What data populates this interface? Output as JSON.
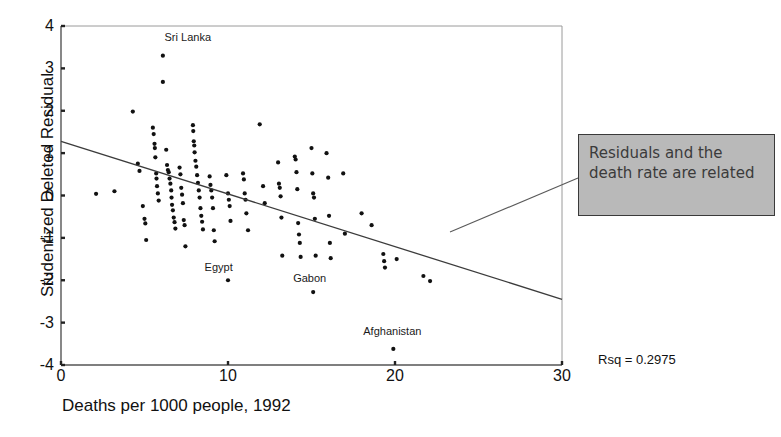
{
  "chart_data": {
    "type": "scatter",
    "title": "",
    "xlabel": "Deaths per 1000 people, 1992",
    "ylabel": "Studentized Deleted Residual",
    "xlim": [
      0,
      30
    ],
    "ylim": [
      -4,
      4
    ],
    "xticks": [
      0,
      10,
      20,
      30
    ],
    "xtick_labels": [
      "0",
      "10",
      "20",
      "30"
    ],
    "yticks": [
      4,
      3,
      2,
      1,
      0,
      -1,
      -2,
      -3,
      -4
    ],
    "ytick_labels": [
      "4",
      "3",
      "2",
      "1",
      "0",
      "-1",
      "-2",
      "-3",
      "-4"
    ],
    "grid": false,
    "legend": null,
    "regression_line": {
      "x0": 0,
      "y0": 1.28,
      "x1": 30,
      "y1": -2.45
    },
    "annotations": [
      {
        "text": "Sri Lanka",
        "x": 6.2,
        "y": 3.72
      },
      {
        "text": "Egypt",
        "x": 8.6,
        "y": -1.72
      },
      {
        "text": "Gabon",
        "x": 13.9,
        "y": -1.98
      },
      {
        "text": "Afghanistan",
        "x": 18.1,
        "y": -3.22
      },
      {
        "text": "Rsq = 0.2975",
        "x": 32.2,
        "y": -4.72
      }
    ],
    "point_labels": [
      "Sri Lanka",
      "Egypt",
      "Gabon",
      "Afghanistan"
    ],
    "points": [
      [
        2.1,
        0.04
      ],
      [
        3.2,
        0.1
      ],
      [
        4.3,
        1.98
      ],
      [
        4.6,
        0.75
      ],
      [
        4.7,
        0.58
      ],
      [
        4.9,
        -0.25
      ],
      [
        5.0,
        -0.55
      ],
      [
        5.05,
        -0.66
      ],
      [
        5.1,
        -1.05
      ],
      [
        5.5,
        1.6
      ],
      [
        5.55,
        1.45
      ],
      [
        5.6,
        1.22
      ],
      [
        5.62,
        1.12
      ],
      [
        5.65,
        0.9
      ],
      [
        5.7,
        0.52
      ],
      [
        5.72,
        0.4
      ],
      [
        5.75,
        0.22
      ],
      [
        5.8,
        0.05
      ],
      [
        5.85,
        -0.12
      ],
      [
        6.1,
        3.3
      ],
      [
        6.1,
        2.68
      ],
      [
        6.3,
        1.08
      ],
      [
        6.35,
        0.72
      ],
      [
        6.4,
        0.6
      ],
      [
        6.45,
        0.55
      ],
      [
        6.5,
        0.4
      ],
      [
        6.55,
        0.28
      ],
      [
        6.6,
        0.12
      ],
      [
        6.62,
        -0.05
      ],
      [
        6.65,
        -0.22
      ],
      [
        6.7,
        -0.35
      ],
      [
        6.75,
        -0.52
      ],
      [
        6.8,
        -0.63
      ],
      [
        6.85,
        -0.78
      ],
      [
        7.1,
        0.66
      ],
      [
        7.15,
        0.5
      ],
      [
        7.2,
        0.18
      ],
      [
        7.25,
        0.02
      ],
      [
        7.3,
        -0.18
      ],
      [
        7.35,
        -0.58
      ],
      [
        7.4,
        -0.7
      ],
      [
        7.45,
        -1.2
      ],
      [
        7.9,
        1.66
      ],
      [
        7.92,
        1.52
      ],
      [
        7.95,
        1.28
      ],
      [
        7.98,
        1.18
      ],
      [
        8.0,
        1.02
      ],
      [
        8.05,
        0.82
      ],
      [
        8.1,
        0.68
      ],
      [
        8.15,
        0.48
      ],
      [
        8.2,
        0.3
      ],
      [
        8.25,
        0.12
      ],
      [
        8.3,
        -0.05
      ],
      [
        8.35,
        -0.3
      ],
      [
        8.4,
        -0.48
      ],
      [
        8.45,
        -0.62
      ],
      [
        8.5,
        -0.8
      ],
      [
        8.9,
        0.45
      ],
      [
        8.95,
        0.25
      ],
      [
        9.0,
        0.12
      ],
      [
        9.05,
        -0.05
      ],
      [
        9.1,
        -0.3
      ],
      [
        9.15,
        -0.82
      ],
      [
        9.2,
        -1.08
      ],
      [
        9.9,
        0.48
      ],
      [
        10.0,
        0.05
      ],
      [
        10.05,
        -0.1
      ],
      [
        10.1,
        -0.25
      ],
      [
        10.15,
        -0.6
      ],
      [
        10.0,
        -2.0
      ],
      [
        10.9,
        0.52
      ],
      [
        10.95,
        0.38
      ],
      [
        11.0,
        0.05
      ],
      [
        11.05,
        -0.1
      ],
      [
        11.1,
        -0.42
      ],
      [
        11.2,
        -0.82
      ],
      [
        11.9,
        1.68
      ],
      [
        12.1,
        0.22
      ],
      [
        12.2,
        -0.18
      ],
      [
        13.0,
        0.78
      ],
      [
        13.05,
        0.28
      ],
      [
        13.1,
        0.18
      ],
      [
        13.15,
        -0.02
      ],
      [
        13.2,
        -0.52
      ],
      [
        13.25,
        -1.42
      ],
      [
        14.0,
        0.92
      ],
      [
        14.05,
        0.85
      ],
      [
        14.1,
        0.55
      ],
      [
        14.15,
        0.15
      ],
      [
        14.2,
        -0.65
      ],
      [
        14.25,
        -0.92
      ],
      [
        14.3,
        -1.12
      ],
      [
        14.35,
        -1.45
      ],
      [
        15.0,
        1.12
      ],
      [
        15.05,
        0.52
      ],
      [
        15.1,
        0.05
      ],
      [
        15.15,
        -0.05
      ],
      [
        15.2,
        -0.55
      ],
      [
        15.25,
        -1.42
      ],
      [
        15.1,
        -2.28
      ],
      [
        15.9,
        1.0
      ],
      [
        16.0,
        0.42
      ],
      [
        16.05,
        -0.48
      ],
      [
        16.1,
        -1.12
      ],
      [
        16.15,
        -1.48
      ],
      [
        16.9,
        0.52
      ],
      [
        17.0,
        -0.9
      ],
      [
        18.0,
        -0.42
      ],
      [
        18.6,
        -0.7
      ],
      [
        19.3,
        -1.38
      ],
      [
        19.35,
        -1.55
      ],
      [
        19.4,
        -1.7
      ],
      [
        19.9,
        -3.62
      ],
      [
        20.1,
        -1.5
      ],
      [
        21.7,
        -1.9
      ],
      [
        22.1,
        -2.02
      ]
    ]
  },
  "callout": {
    "text": "Residuals and the death rate are related",
    "background": "#b9b9b9",
    "border_color": "#3a3a3a"
  },
  "stats": {
    "rsq_label": "Rsq = 0.2975"
  }
}
